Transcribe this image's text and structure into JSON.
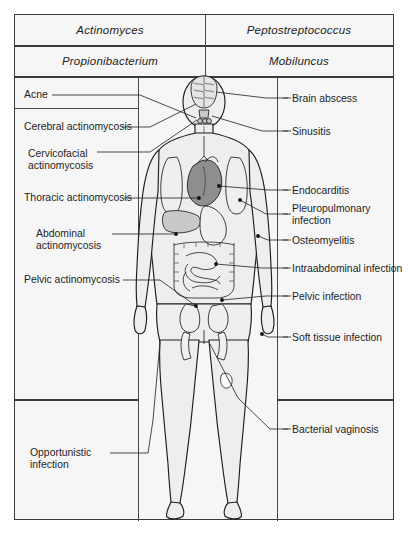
{
  "header": {
    "cells": [
      {
        "label": "Actinomyces",
        "column": "left",
        "row": 1
      },
      {
        "label": "Peptostreptococcus",
        "column": "right",
        "row": 1
      },
      {
        "label": "Propionibacterium",
        "column": "left",
        "row": 2
      },
      {
        "label": "Mobiluncus",
        "column": "right",
        "row": 2
      }
    ]
  },
  "labels_left": [
    {
      "text": "Acne"
    },
    {
      "text": "Cerebral actinomycosis"
    },
    {
      "text": "Cervicofacial\nactinomycosis"
    },
    {
      "text": "Thoracic actinomycosis"
    },
    {
      "text": "Abdominal\nactinomycosis"
    },
    {
      "text": "Pelvic actinomycosis"
    },
    {
      "text": "Opportunistic\ninfection"
    }
  ],
  "labels_right": [
    {
      "text": "Brain abscess"
    },
    {
      "text": "Sinusitis"
    },
    {
      "text": "Endocarditis"
    },
    {
      "text": "Pleuropulmonary\ninfection"
    },
    {
      "text": "Osteomyelitis"
    },
    {
      "text": "Intraabdominal infection"
    },
    {
      "text": "Pelvic infection"
    },
    {
      "text": "Soft tissue infection"
    },
    {
      "text": "Bacterial vaginosis"
    }
  ],
  "colors": {
    "frame_border": "#3a3a3a",
    "grid_line": "#4a4a4a",
    "panel_background": "#f6f6f6",
    "page_background": "#ffffff",
    "leader_line": "#2b2b2b",
    "body_fill": "#eeeeee",
    "body_outline": "#1d1d1d",
    "organ_dark": "#8e8e8e",
    "organ_medium": "#c9c9c9",
    "organ_light": "#efefef",
    "text": "#1e1e1e"
  }
}
